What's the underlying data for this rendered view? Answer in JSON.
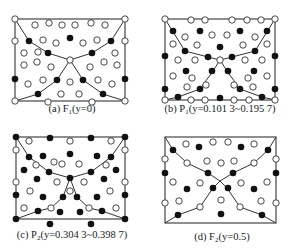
{
  "figure": {
    "colors": {
      "line": "#333333",
      "filled": "#111111",
      "open_stroke": "#333333",
      "open_fill": "#ffffff"
    },
    "panels": [
      {
        "id": "a",
        "caption": {
          "prefix": "(a) ",
          "symbol": "F",
          "sub": "1",
          "param": "(y=0)",
          "x": 72,
          "y": 103
        },
        "rect": [
          15,
          19,
          125,
          101
        ],
        "center": [
          70,
          60
        ],
        "paths": [
          [
            [
              15,
              19
            ],
            [
              29,
              41
            ],
            [
              48,
              53
            ],
            [
              70,
              60
            ],
            [
              92,
              53
            ],
            [
              111,
              41
            ],
            [
              125,
              19
            ]
          ],
          [
            [
              15,
              101
            ],
            [
              38,
              94
            ],
            [
              57,
              80
            ],
            [
              70,
              60
            ],
            [
              83,
              80
            ],
            [
              103,
              94
            ],
            [
              125,
              101
            ]
          ]
        ],
        "open": [
          [
            15,
            19
          ],
          [
            125,
            19
          ],
          [
            15,
            101
          ],
          [
            125,
            101
          ],
          [
            70,
            60
          ],
          [
            35,
            25
          ],
          [
            49,
            23
          ],
          [
            62,
            25
          ],
          [
            75,
            25
          ],
          [
            91,
            23
          ],
          [
            105,
            25
          ],
          [
            43,
            40
          ],
          [
            56,
            43
          ],
          [
            83,
            43
          ],
          [
            97,
            40
          ],
          [
            125,
            41
          ],
          [
            15,
            41
          ],
          [
            24,
            53
          ],
          [
            38,
            52
          ],
          [
            115,
            53
          ],
          [
            24,
            65
          ],
          [
            37,
            62
          ],
          [
            51,
            67
          ],
          [
            90,
            67
          ],
          [
            104,
            62
          ],
          [
            117,
            65
          ],
          [
            28,
            84
          ],
          [
            43,
            80
          ],
          [
            70,
            82
          ],
          [
            98,
            80
          ],
          [
            112,
            84
          ],
          [
            61,
            94
          ],
          [
            79,
            94
          ],
          [
            48,
            102
          ],
          [
            92,
            102
          ]
        ],
        "filled": [
          [
            29,
            41
          ],
          [
            70,
            38
          ],
          [
            111,
            41
          ],
          [
            48,
            53
          ],
          [
            92,
            53
          ],
          [
            57,
            80
          ],
          [
            83,
            80
          ],
          [
            15,
            79
          ],
          [
            125,
            79
          ],
          [
            38,
            94
          ],
          [
            103,
            94
          ]
        ]
      },
      {
        "id": "b",
        "caption": {
          "prefix": "(b) ",
          "symbol": "P",
          "sub": "1",
          "param": "(y=0.101 3~0.195 7)",
          "x": 220,
          "y": 103
        },
        "rect": [
          165,
          19,
          275,
          100
        ],
        "center": [
          220,
          60
        ],
        "paths": [
          [
            [
              165,
              19
            ],
            [
              185,
              51
            ],
            [
              208,
              57
            ],
            [
              220,
              60
            ],
            [
              232,
              57
            ],
            [
              255,
              51
            ],
            [
              275,
              19
            ]
          ],
          [
            [
              165,
              100
            ],
            [
              178,
              97
            ],
            [
              200,
              89
            ],
            [
              213,
              71
            ],
            [
              220,
              60
            ],
            [
              227,
              71
            ],
            [
              240,
              89
            ],
            [
              262,
              97
            ],
            [
              275,
              100
            ]
          ]
        ],
        "open": [
          [
            165,
            19
          ],
          [
            275,
            19
          ],
          [
            165,
            100
          ],
          [
            275,
            100
          ],
          [
            220,
            60
          ],
          [
            191,
            20
          ],
          [
            205,
            20
          ],
          [
            232,
            20
          ],
          [
            247,
            20
          ],
          [
            261,
            20
          ],
          [
            185,
            37
          ],
          [
            212,
            35
          ],
          [
            227,
            35
          ],
          [
            255,
            37
          ],
          [
            173,
            44
          ],
          [
            197,
            45
          ],
          [
            243,
            45
          ],
          [
            267,
            44
          ],
          [
            178,
            60
          ],
          [
            195,
            60
          ],
          [
            245,
            60
          ],
          [
            262,
            60
          ],
          [
            173,
            76
          ],
          [
            192,
            78
          ],
          [
            248,
            78
          ],
          [
            267,
            76
          ],
          [
            187,
            87
          ],
          [
            206,
            85
          ],
          [
            234,
            85
          ],
          [
            253,
            87
          ],
          [
            191,
            100
          ],
          [
            205,
            100
          ],
          [
            234,
            100
          ],
          [
            249,
            100
          ]
        ],
        "filled": [
          [
            173,
            31
          ],
          [
            200,
            31
          ],
          [
            240,
            31
          ],
          [
            267,
            31
          ],
          [
            185,
            51
          ],
          [
            220,
            47
          ],
          [
            255,
            51
          ],
          [
            165,
            56
          ],
          [
            208,
            57
          ],
          [
            232,
            57
          ],
          [
            275,
            56
          ],
          [
            212,
            71
          ],
          [
            228,
            71
          ],
          [
            186,
            71
          ],
          [
            254,
            71
          ],
          [
            165,
            89
          ],
          [
            200,
            89
          ],
          [
            240,
            89
          ],
          [
            275,
            89
          ],
          [
            178,
            97
          ],
          [
            220,
            98
          ],
          [
            262,
            97
          ]
        ]
      },
      {
        "id": "c",
        "caption": {
          "prefix": "(c) ",
          "symbol": "P",
          "sub": "2",
          "param": "(y=0.304 3~0.398 7)",
          "x": 72,
          "y": 229
        },
        "rect": [
          16,
          137,
          125,
          219
        ],
        "center": [
          70,
          178
        ],
        "paths": [
          [
            [
              16,
              137
            ],
            [
              29,
              157
            ],
            [
              49,
              172
            ],
            [
              70,
              178
            ],
            [
              91,
              172
            ],
            [
              111,
              157
            ],
            [
              125,
              137
            ]
          ],
          [
            [
              16,
              219
            ],
            [
              38,
              211
            ],
            [
              51,
              208
            ],
            [
              63,
              197
            ],
            [
              70,
              178
            ],
            [
              77,
              197
            ],
            [
              89,
              208
            ],
            [
              102,
              211
            ],
            [
              125,
              219
            ]
          ]
        ],
        "open": [
          [
            29,
            141
          ],
          [
            70,
            141
          ],
          [
            111,
            141
          ],
          [
            16,
            150
          ],
          [
            125,
            150
          ],
          [
            54,
            162
          ],
          [
            79,
            164
          ],
          [
            62,
            164
          ],
          [
            36,
            165
          ],
          [
            106,
            165
          ],
          [
            16,
            182
          ],
          [
            125,
            182
          ],
          [
            57,
            182
          ],
          [
            84,
            182
          ],
          [
            30,
            191
          ],
          [
            70,
            191
          ],
          [
            110,
            191
          ],
          [
            24,
            208
          ],
          [
            51,
            208
          ],
          [
            89,
            208
          ],
          [
            116,
            208
          ]
        ],
        "filled": [
          [
            16,
            137
          ],
          [
            125,
            137
          ],
          [
            50,
            138
          ],
          [
            91,
            138
          ],
          [
            29,
            157
          ],
          [
            43,
            156
          ],
          [
            70,
            154
          ],
          [
            97,
            156
          ],
          [
            111,
            157
          ],
          [
            24,
            170
          ],
          [
            49,
            172
          ],
          [
            91,
            172
          ],
          [
            116,
            170
          ],
          [
            37,
            179
          ],
          [
            70,
            178
          ],
          [
            104,
            179
          ],
          [
            16,
            195
          ],
          [
            125,
            195
          ],
          [
            43,
            197
          ],
          [
            63,
            197
          ],
          [
            77,
            197
          ],
          [
            97,
            197
          ],
          [
            38,
            211
          ],
          [
            102,
            211
          ],
          [
            60,
            212
          ],
          [
            80,
            212
          ],
          [
            16,
            219
          ],
          [
            125,
            219
          ],
          [
            50,
            224
          ],
          [
            91,
            224
          ]
        ]
      },
      {
        "id": "d",
        "caption": {
          "prefix": "(d) ",
          "symbol": "F",
          "sub": "2",
          "param": "(y=0.5)",
          "x": 222,
          "y": 231
        },
        "rect": [
          165,
          137,
          276,
          223
        ],
        "center": [
          220,
          181
        ],
        "paths": [
          [
            [
              165,
              137
            ],
            [
              173,
              150
            ],
            [
              187,
              163
            ],
            [
              208,
              173
            ],
            [
              220,
              181
            ],
            [
              233,
              173
            ],
            [
              254,
              163
            ],
            [
              268,
              150
            ],
            [
              276,
              137
            ]
          ],
          [
            [
              165,
              223
            ],
            [
              178,
              215
            ],
            [
              200,
              207
            ],
            [
              213,
              188
            ],
            [
              220,
              181
            ],
            [
              227,
              188
            ],
            [
              240,
              207
            ],
            [
              262,
              215
            ],
            [
              276,
              223
            ]
          ]
        ],
        "open": [
          [
            186,
            144
          ],
          [
            213,
            142
          ],
          [
            228,
            142
          ],
          [
            254,
            144
          ],
          [
            165,
            159
          ],
          [
            276,
            159
          ],
          [
            187,
            163
          ],
          [
            254,
            163
          ],
          [
            207,
            161
          ],
          [
            221,
            163
          ],
          [
            234,
            161
          ],
          [
            173,
            182
          ],
          [
            200,
            183
          ],
          [
            241,
            183
          ],
          [
            267,
            182
          ],
          [
            165,
            203
          ],
          [
            276,
            203
          ],
          [
            179,
            201
          ],
          [
            221,
            200
          ],
          [
            261,
            201
          ],
          [
            200,
            207
          ],
          [
            240,
            207
          ]
        ],
        "filled": [
          [
            173,
            150
          ],
          [
            199,
            147
          ],
          [
            241,
            147
          ],
          [
            268,
            150
          ],
          [
            165,
            173
          ],
          [
            208,
            173
          ],
          [
            233,
            173
          ],
          [
            276,
            173
          ],
          [
            187,
            189
          ],
          [
            213,
            188
          ],
          [
            228,
            188
          ],
          [
            254,
            189
          ],
          [
            178,
            215
          ],
          [
            221,
            214
          ],
          [
            262,
            215
          ]
        ]
      }
    ]
  }
}
